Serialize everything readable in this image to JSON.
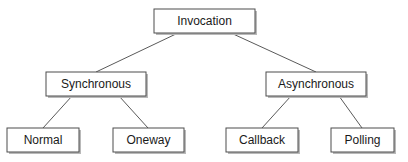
{
  "diagram": {
    "type": "tree",
    "title": "Invocation",
    "canvas": {
      "width": 408,
      "height": 162,
      "background": "#ffffff"
    },
    "style": {
      "box_fill": "#ffffff",
      "box_stroke": "#4d4d4d",
      "shadow_color": "#b9b9b9",
      "edge_color": "#5a5a5a",
      "text_color": "#1a1a1a",
      "font_size": 12
    },
    "nodes": [
      {
        "id": "invocation",
        "label": "Invocation",
        "level": 0,
        "x": 154,
        "y": 9,
        "w": 101,
        "h": 24,
        "cx": 204.5,
        "cy": 21
      },
      {
        "id": "synchronous",
        "label": "Synchronous",
        "level": 1,
        "x": 46,
        "y": 72,
        "w": 100,
        "h": 24,
        "cx": 96,
        "cy": 84
      },
      {
        "id": "asynchronous",
        "label": "Asynchronous",
        "level": 1,
        "x": 266,
        "y": 72,
        "w": 100,
        "h": 24,
        "cx": 316,
        "cy": 84
      },
      {
        "id": "normal",
        "label": "Normal",
        "level": 2,
        "x": 7,
        "y": 128,
        "w": 72,
        "h": 24,
        "cx": 43,
        "cy": 140
      },
      {
        "id": "oneway",
        "label": "Oneway",
        "level": 2,
        "x": 113,
        "y": 128,
        "w": 71,
        "h": 24,
        "cx": 148.5,
        "cy": 140
      },
      {
        "id": "callback",
        "label": "Callback",
        "level": 2,
        "x": 226,
        "y": 128,
        "w": 72,
        "h": 24,
        "cx": 262,
        "cy": 140
      },
      {
        "id": "polling",
        "label": "Polling",
        "level": 2,
        "x": 331,
        "y": 128,
        "w": 63,
        "h": 24,
        "cx": 362.5,
        "cy": 140
      }
    ],
    "edges": [
      {
        "id": "invocation-synchronous",
        "from": "invocation",
        "to": "synchronous",
        "x1": 178,
        "y1": 33,
        "x2": 96,
        "y2": 72
      },
      {
        "id": "invocation-asynchronous",
        "from": "invocation",
        "to": "asynchronous",
        "x1": 231,
        "y1": 33,
        "x2": 316,
        "y2": 72
      },
      {
        "id": "synchronous-normal",
        "from": "synchronous",
        "to": "normal",
        "x1": 72,
        "y1": 96,
        "x2": 43,
        "y2": 128
      },
      {
        "id": "synchronous-oneway",
        "from": "synchronous",
        "to": "oneway",
        "x1": 119,
        "y1": 96,
        "x2": 148,
        "y2": 128
      },
      {
        "id": "asynchronous-callback",
        "from": "asynchronous",
        "to": "callback",
        "x1": 291,
        "y1": 96,
        "x2": 262,
        "y2": 128
      },
      {
        "id": "asynchronous-polling",
        "from": "asynchronous",
        "to": "polling",
        "x1": 339,
        "y1": 96,
        "x2": 362,
        "y2": 128
      }
    ]
  }
}
